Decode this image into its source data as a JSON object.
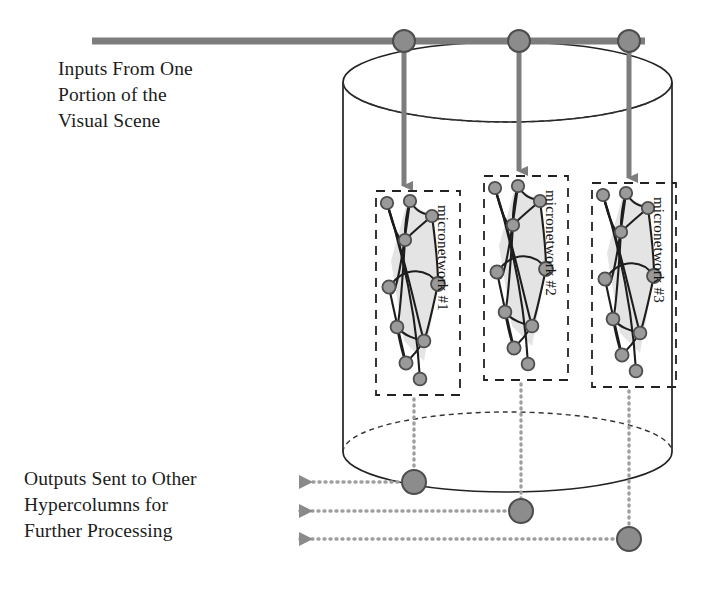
{
  "figure": {
    "background_color": "#ffffff"
  },
  "annotations": {
    "input_label": "Inputs From One\nPortion of the\nVisual Scene",
    "input_label_lines": [
      "Inputs From One",
      "Portion of the",
      "Visual Scene"
    ],
    "output_label": "Outputs Sent to Other\nHypercolumns for\nFurther Processing",
    "output_label_lines": [
      "Outputs Sent to Other",
      "Hypercolumns for",
      "Further Processing"
    ]
  },
  "micronetworks": [
    {
      "id": "m1",
      "label": "micronetwork #1"
    },
    {
      "id": "m2",
      "label": "micronetwork #2"
    },
    {
      "id": "m3",
      "label": "micronetwork #3"
    }
  ],
  "colors": {
    "line_dark": "#1a1a1a",
    "gray_fill": "#8c8c8c",
    "gray_stroke": "#5a5a5a",
    "bar_gray": "#7d7d7d",
    "node_fill": "#9a9a9a",
    "node_stroke": "#4d4d4d",
    "shade_fill": "#e2e2e2",
    "dotted_gray": "#9e9e9e",
    "cylinder_stroke": "#222222"
  },
  "geometry": {
    "cylinder": {
      "left": 343,
      "right": 672,
      "top_center_y": 82,
      "bottom_center_y": 452,
      "ellipse_ry": 40
    },
    "input_bar": {
      "x1": 92,
      "x2": 645,
      "y": 41,
      "thickness": 7
    },
    "input_nodes_x": [
      404,
      519,
      629
    ],
    "output_nodes": [
      {
        "cx": 414,
        "cy": 482,
        "arrow_x": 293
      },
      {
        "cx": 521,
        "cy": 511,
        "arrow_x": 293
      },
      {
        "cx": 629,
        "cy": 539,
        "arrow_x": 293
      }
    ],
    "boxes": [
      {
        "x": 376,
        "y": 191,
        "w": 84,
        "h": 204
      },
      {
        "x": 484,
        "y": 176,
        "w": 84,
        "h": 204
      },
      {
        "x": 592,
        "y": 183,
        "w": 84,
        "h": 204
      }
    ]
  }
}
